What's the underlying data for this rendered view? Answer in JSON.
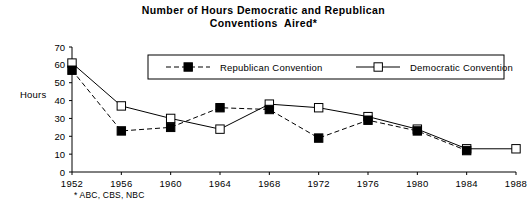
{
  "chart_data": {
    "type": "line",
    "title": "Number of Hours Democratic and Republican Conventions Aired*",
    "title_line1": "Number of Hours Democratic and Republican",
    "title_line2": "Conventions  Aired*",
    "xlabel": "",
    "ylabel": "Hours",
    "x": [
      1952,
      1956,
      1960,
      1964,
      1968,
      1972,
      1976,
      1980,
      1984,
      1988
    ],
    "categories": [
      "1952",
      "1956",
      "1960",
      "1964",
      "1968",
      "1972",
      "1976",
      "1980",
      "1984",
      "1988"
    ],
    "xlim": [
      1952,
      1988
    ],
    "ylim": [
      0,
      70
    ],
    "yticks": [
      0,
      10,
      20,
      30,
      40,
      50,
      60,
      70
    ],
    "ytick_labels": [
      "0",
      "10",
      "20",
      "30",
      "40",
      "50",
      "60",
      "70"
    ],
    "grid": false,
    "legend_position": "top-center",
    "annotation": "* ABC, CBS, NBC",
    "series": [
      {
        "name": "Republican Convention",
        "marker": "filled-square",
        "line_style": "dashed",
        "color": "#000000",
        "values": [
          57,
          23,
          25,
          36,
          35,
          19,
          29,
          23,
          12,
          null
        ]
      },
      {
        "name": "Democratic Convention",
        "marker": "open-square",
        "line_style": "solid",
        "color": "#000000",
        "values": [
          61,
          37,
          30,
          24,
          38,
          36,
          31,
          24,
          13,
          13
        ]
      }
    ]
  },
  "legend": {
    "items": [
      {
        "label": "Republican Convention"
      },
      {
        "label": "Democratic Convention"
      }
    ]
  }
}
